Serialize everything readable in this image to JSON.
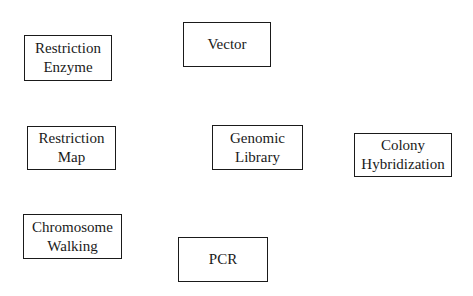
{
  "diagram": {
    "nodes": [
      {
        "id": "restriction-enzyme",
        "lines": [
          "Restriction",
          "Enzyme"
        ]
      },
      {
        "id": "vector",
        "lines": [
          "Vector"
        ]
      },
      {
        "id": "restriction-map",
        "lines": [
          "Restriction",
          "Map"
        ]
      },
      {
        "id": "genomic-library",
        "lines": [
          "Genomic",
          "Library"
        ]
      },
      {
        "id": "colony-hybridization",
        "lines": [
          "Colony",
          "Hybridization"
        ]
      },
      {
        "id": "chromosome-walking",
        "lines": [
          "Chromosome",
          "Walking"
        ]
      },
      {
        "id": "pcr",
        "lines": [
          "PCR"
        ]
      }
    ],
    "colors": {
      "border": "#1a1a1a",
      "text": "#1a1a1a",
      "background": "#ffffff"
    }
  }
}
